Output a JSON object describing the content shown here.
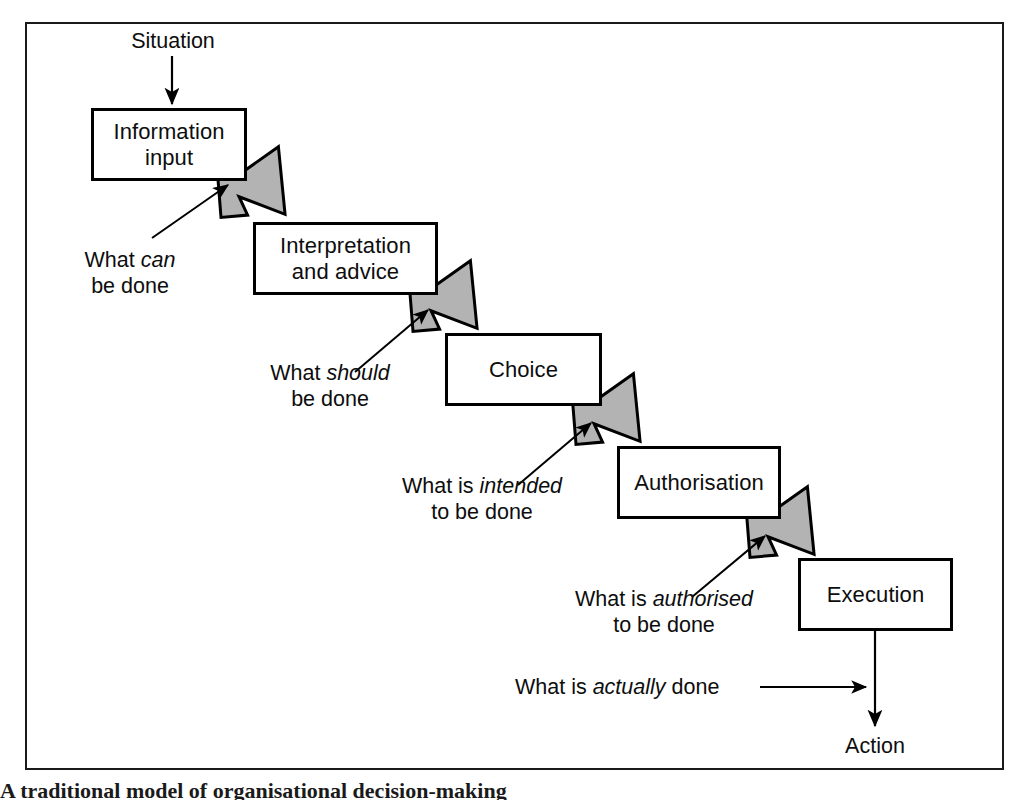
{
  "figure": {
    "caption": "A traditional model of organisational decision-making",
    "frame_color": "#1a1a1a",
    "box_border_color": "#000000",
    "arrow_fill_color": "#b3b3b3",
    "arrow_outline_color": "#000000",
    "background_color": "#ffffff"
  },
  "inputs": {
    "situation_label": "Situation"
  },
  "stages": [
    {
      "id": "information-input",
      "line1": "Information",
      "line2": "input"
    },
    {
      "id": "interpretation-and-advice",
      "line1": "Interpretation",
      "line2": "and advice"
    },
    {
      "id": "choice",
      "line1": "Choice",
      "line2": ""
    },
    {
      "id": "authorisation",
      "line1": "Authorisation",
      "line2": ""
    },
    {
      "id": "execution",
      "line1": "Execution",
      "line2": ""
    }
  ],
  "annotations": [
    {
      "id": "what-can-be-done",
      "line1_pre": "What ",
      "line1_em": "can",
      "line1_post": "",
      "line2": "be done"
    },
    {
      "id": "what-should-be-done",
      "line1_pre": "What ",
      "line1_em": "should",
      "line1_post": "",
      "line2": "be done"
    },
    {
      "id": "what-is-intended-to-be-done",
      "line1_pre": "What is ",
      "line1_em": "intended",
      "line1_post": "",
      "line2": "to be done"
    },
    {
      "id": "what-is-authorised-to-be-done",
      "line1_pre": "What is ",
      "line1_em": "authorised",
      "line1_post": "",
      "line2": "to be done"
    },
    {
      "id": "what-is-actually-done",
      "line1_pre": "What is ",
      "line1_em": "actually",
      "line1_post": " done",
      "line2": ""
    }
  ],
  "outputs": {
    "action_label": "Action"
  }
}
